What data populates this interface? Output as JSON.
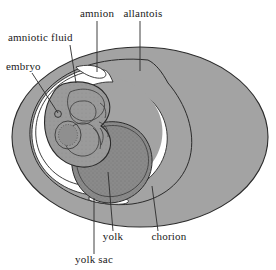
{
  "figure": {
    "name": "amniotic-egg-diagram",
    "background_color": "#ffffff"
  },
  "colors": {
    "egg_shell_fill": "#a3a3a3",
    "chorion_fill": "#a3a3a3",
    "amniotic_fluid_fill": "#ffffff",
    "embryo_fill": "#9a9a9a",
    "embryo_inner_fill": "#8f8f8f",
    "yolk_fill": "#8a8a8a",
    "outline_stroke": "#2b2b2b",
    "leader_stroke": "#2b2b2b",
    "text_color": "#1a1a1a"
  },
  "labels": [
    {
      "id": "amnion",
      "text": "amnion",
      "text_x": 97,
      "text_y": 17,
      "anchor": "middle",
      "leader": "M 97,21 L 97,72"
    },
    {
      "id": "allantois",
      "text": "allantois",
      "text_x": 143,
      "text_y": 17,
      "anchor": "middle",
      "leader": "M 140,21 L 140,71"
    },
    {
      "id": "amniotic-fluid",
      "text": "amniotic fluid",
      "text_x": 8,
      "text_y": 41,
      "anchor": "start",
      "leader": "M 70,45 L 76,83"
    },
    {
      "id": "embryo",
      "text": "embryo",
      "text_x": 6,
      "text_y": 70,
      "anchor": "start",
      "leader": "M 32,73 L 58,113"
    },
    {
      "id": "yolk",
      "text": "yolk",
      "text_x": 113,
      "text_y": 240,
      "anchor": "middle",
      "leader": "M 113,231 L 108,172"
    },
    {
      "id": "chorion",
      "text": "chorion",
      "text_x": 169,
      "text_y": 240,
      "anchor": "middle",
      "leader": "M 158,231 L 152,186"
    },
    {
      "id": "yolk-sac",
      "text": "yolk sac",
      "text_x": 94,
      "text_y": 263,
      "anchor": "middle",
      "leader": "M 94,254 L 94,198"
    }
  ],
  "structures": [
    {
      "id": "egg-shell",
      "label": "egg shell outer ellipse"
    },
    {
      "id": "chorion-layer",
      "label": "chorion"
    },
    {
      "id": "allantois-space",
      "label": "allantois"
    },
    {
      "id": "amniotic-cavity",
      "label": "amniotic fluid"
    },
    {
      "id": "embryo-body",
      "label": "embryo"
    },
    {
      "id": "yolk-sac-body",
      "label": "yolk sac"
    },
    {
      "id": "yolk-mass",
      "label": "yolk"
    }
  ]
}
